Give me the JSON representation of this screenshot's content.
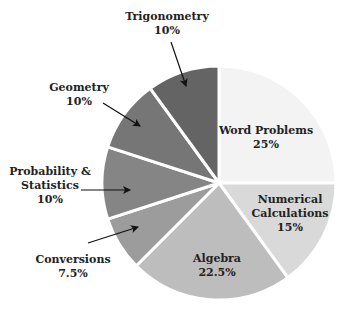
{
  "chart_data": {
    "type": "pie",
    "title": "",
    "start_angle_deg": 0,
    "direction": "clockwise-from-top",
    "slices": [
      {
        "label": "Word Problems",
        "value": 25,
        "display": "25%",
        "color": "#f3f3f3",
        "label_inside": true
      },
      {
        "label": "Numerical Calculations",
        "value": 15,
        "display": "15%",
        "color": "#d9d9d9",
        "label_inside": true
      },
      {
        "label": "Algebra",
        "value": 22.5,
        "display": "22.5%",
        "color": "#bdbdbd",
        "label_inside": true
      },
      {
        "label": "Conversions",
        "value": 7.5,
        "display": "7.5%",
        "color": "#9c9c9c",
        "label_inside": false
      },
      {
        "label": "Probability & Statistics",
        "value": 10,
        "display": "10%",
        "color": "#858585",
        "label_inside": false
      },
      {
        "label": "Geometry",
        "value": 10,
        "display": "10%",
        "color": "#767676",
        "label_inside": false
      },
      {
        "label": "Trigonometry",
        "value": 10,
        "display": "10%",
        "color": "#646464",
        "label_inside": false
      }
    ]
  },
  "labels": {
    "word_problems": {
      "name": "Word Problems",
      "pct": "25%"
    },
    "numerical": {
      "name1": "Numerical",
      "name2": "Calculations",
      "pct": "15%"
    },
    "algebra": {
      "name": "Algebra",
      "pct": "22.5%"
    },
    "conversions": {
      "name": "Conversions",
      "pct": "7.5%"
    },
    "probability": {
      "name1": "Probability &",
      "name2": "Statistics",
      "pct": "10%"
    },
    "geometry": {
      "name": "Geometry",
      "pct": "10%"
    },
    "trigonometry": {
      "name": "Trigonometry",
      "pct": "10%"
    }
  }
}
